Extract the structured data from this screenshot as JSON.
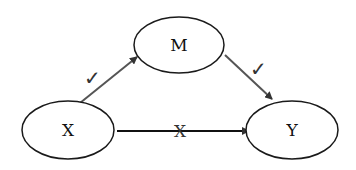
{
  "diagram": {
    "type": "mediation-model",
    "nodes": [
      {
        "id": "M",
        "label": "M",
        "cx": 179,
        "cy": 45,
        "rx": 45,
        "ry": 28
      },
      {
        "id": "X",
        "label": "X",
        "cx": 68,
        "cy": 130,
        "rx": 46,
        "ry": 29
      },
      {
        "id": "Y",
        "label": "Y",
        "cx": 292,
        "cy": 130,
        "rx": 46,
        "ry": 29
      }
    ],
    "edges": [
      {
        "from": "X",
        "to": "M",
        "mark": "✓",
        "status": "significant"
      },
      {
        "from": "M",
        "to": "Y",
        "mark": "✓",
        "status": "significant"
      },
      {
        "from": "X",
        "to": "Y",
        "mark": "X",
        "status": "not-significant"
      }
    ],
    "colors": {
      "stroke": "#1a1a1a",
      "arrow": "#444444",
      "background": "#ffffff"
    }
  }
}
